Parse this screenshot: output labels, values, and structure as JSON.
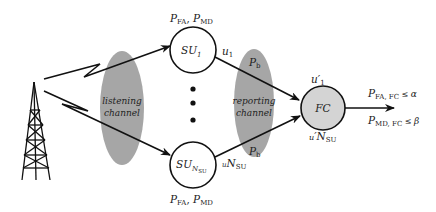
{
  "colors": {
    "background": "#ffffff",
    "stroke": "#111111",
    "channel_fill": "#a6a6a6",
    "fc_fill": "#d4d4d4"
  },
  "nodes": {
    "su_first": {
      "name": "SU",
      "subscript": "1",
      "above_label": {
        "p1": "P",
        "p1_sub": "FA",
        "sep": ", ",
        "p2": "P",
        "p2_sub": "MD"
      },
      "output": {
        "base": "u",
        "sub": "1"
      }
    },
    "su_last": {
      "name": "SU",
      "subscript": "N",
      "subsubscript": "SU",
      "below_label": {
        "p1": "P",
        "p1_sub": "FA",
        "sep": ", ",
        "p2": "P",
        "p2_sub": "MD"
      },
      "output": {
        "base": "u",
        "sub": "N",
        "subsub": "SU"
      }
    },
    "fc": {
      "name": "FC",
      "input_first": {
        "base": "u",
        "prime": "′",
        "sub": "1"
      },
      "input_last": {
        "base": "u",
        "prime": "′",
        "sub": "N",
        "subsub": "SU"
      }
    }
  },
  "channels": {
    "listening": {
      "line1": "listening",
      "line2": "channel"
    },
    "reporting": {
      "line1": "reporting",
      "line2": "channel",
      "top_label": {
        "p": "P",
        "sub": "b"
      },
      "bottom_label": {
        "p": "P",
        "sub": "b"
      }
    }
  },
  "output_constraints": {
    "fa": {
      "p": "P",
      "sub": "FA, FC",
      "rel": " ≤ ",
      "bound": "α"
    },
    "md": {
      "p": "P",
      "sub": "MD, FC",
      "rel": " ≤ ",
      "bound": "β"
    }
  },
  "icons": [
    "transmitter-tower-icon",
    "wireless-link-icon"
  ]
}
